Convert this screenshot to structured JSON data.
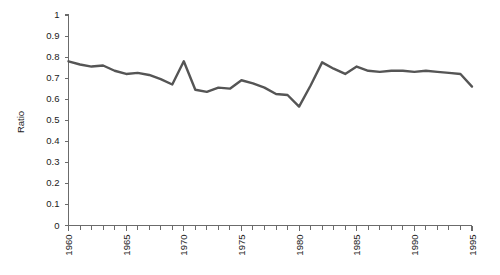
{
  "chart_data": {
    "type": "line",
    "title": "",
    "subtitle": "",
    "xlabel": "",
    "ylabel": "Ratio",
    "grid": false,
    "legend": false,
    "legend_position": "none",
    "xlim": [
      1960,
      1995
    ],
    "ylim": [
      0,
      1
    ],
    "y_tick_step": 0.1,
    "x_tick_step": 1,
    "x_label_step": 5,
    "line_color": "#555555",
    "axis_color": "#6b6b6b",
    "text_color": "#1a1a1a",
    "background_color": "#ffffff",
    "ytick_labels": [
      "0",
      "0.1",
      "0.2",
      "0.3",
      "0.4",
      "0.5",
      "0.6",
      "0.7",
      "0.8",
      "0.9",
      "1"
    ],
    "ytick_values": [
      0,
      0.1,
      0.2,
      0.3,
      0.4,
      0.5,
      0.6,
      0.7,
      0.8,
      0.9,
      1
    ],
    "xtick_labels": [
      "1960",
      "1965",
      "1970",
      "1975",
      "1980",
      "1985",
      "1990",
      "1995"
    ],
    "xtick_label_values": [
      1960,
      1965,
      1970,
      1975,
      1980,
      1985,
      1990,
      1995
    ],
    "x": [
      1960,
      1961,
      1962,
      1963,
      1964,
      1965,
      1966,
      1967,
      1968,
      1969,
      1970,
      1971,
      1972,
      1973,
      1974,
      1975,
      1976,
      1977,
      1978,
      1979,
      1980,
      1981,
      1982,
      1983,
      1984,
      1985,
      1986,
      1987,
      1988,
      1989,
      1990,
      1991,
      1992,
      1993,
      1994,
      1995
    ],
    "series": [
      {
        "name": "Ratio",
        "color": "#555555",
        "values": [
          0.78,
          0.765,
          0.755,
          0.76,
          0.735,
          0.72,
          0.725,
          0.715,
          0.695,
          0.67,
          0.78,
          0.645,
          0.635,
          0.655,
          0.65,
          0.69,
          0.675,
          0.655,
          0.625,
          0.62,
          0.565,
          0.665,
          0.775,
          0.745,
          0.72,
          0.755,
          0.735,
          0.73,
          0.735,
          0.735,
          0.73,
          0.735,
          0.73,
          0.725,
          0.72,
          0.66
        ]
      }
    ],
    "annotations": []
  },
  "axis": {
    "y_title": "Ratio"
  }
}
